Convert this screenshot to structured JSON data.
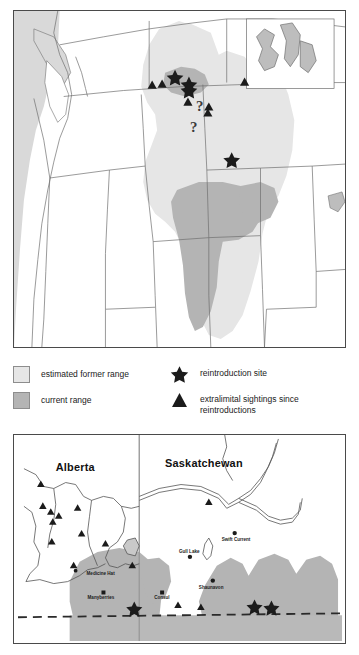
{
  "figure": {
    "panels": [
      "range-map-north-america",
      "range-map-alberta-saskatchewan"
    ]
  },
  "legend": {
    "former_range_label": "estimated former range",
    "current_range_label": "current range",
    "reintroduction_label": "reintroduction site",
    "extralimital_label": "extralimital sightings since\nreintroductions",
    "colors": {
      "former_range": "#e6e6e6",
      "current_range": "#b4b4b4",
      "marker": "#1b1b1b",
      "outline": "#4a4a4a"
    },
    "icons": {
      "former_swatch": "square-light-swatch",
      "current_swatch": "square-gray-swatch",
      "reintroduction": "star-icon",
      "extralimital": "triangle-icon"
    }
  },
  "top_map": {
    "name": "north-america-range-map",
    "annotations": [
      "?",
      "?"
    ],
    "reintroduction_sites": 3,
    "extralimital_sightings": 6
  },
  "bottom_map": {
    "name": "prairie-detail-map",
    "province_labels": [
      "Alberta",
      "Saskatchewan"
    ],
    "places": [
      {
        "name": "Medicine Hat",
        "x": 96,
        "y": 141
      },
      {
        "name": "Manyberries",
        "x": 75,
        "y": 148
      },
      {
        "name": "Consul",
        "x": 125,
        "y": 132
      },
      {
        "name": "Gull Lake",
        "x": 147,
        "y": 115
      },
      {
        "name": "Swift Current",
        "x": 195,
        "y": 102
      },
      {
        "name": "Shaunavon",
        "x": 168,
        "y": 152
      }
    ],
    "reintroduction_sites": 3,
    "extralimital_sightings": 13,
    "border_style": "dashed"
  }
}
